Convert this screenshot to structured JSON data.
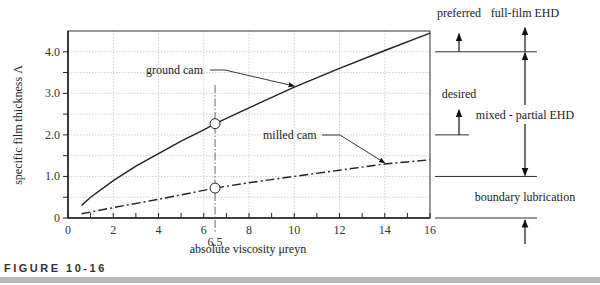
{
  "chart_data": {
    "type": "line",
    "title": "",
    "xlabel": "absolute viscosity   μreyn",
    "ylabel": "specific film thickness  Λ",
    "xlim": [
      0,
      16
    ],
    "ylim": [
      0,
      4.5
    ],
    "x_ticks": [
      0,
      2,
      4,
      6,
      8,
      10,
      12,
      14,
      16
    ],
    "y_ticks": [
      "0",
      "1.0",
      "2.0",
      "3.0",
      "4.0"
    ],
    "y_tick_values": [
      0,
      1,
      2,
      3,
      4
    ],
    "grid": true,
    "series": [
      {
        "name": "ground cam",
        "style": "solid",
        "x": [
          0.6,
          1,
          2,
          3,
          4,
          5,
          6,
          6.5,
          8,
          10,
          12,
          14,
          16
        ],
        "y": [
          0.3,
          0.5,
          0.9,
          1.25,
          1.55,
          1.85,
          2.12,
          2.27,
          2.65,
          3.15,
          3.6,
          4.03,
          4.45
        ]
      },
      {
        "name": "milled cam",
        "style": "dash-dot",
        "x": [
          0.6,
          2,
          4,
          6.5,
          8,
          10,
          12,
          14,
          16
        ],
        "y": [
          0.1,
          0.25,
          0.45,
          0.72,
          0.85,
          1.0,
          1.15,
          1.3,
          1.4
        ]
      }
    ],
    "annotations": [
      {
        "text": "6.5",
        "x": 6.5,
        "note": "marker line at viscosity 6.5"
      },
      {
        "text": "ground cam",
        "points_to_x": 10
      },
      {
        "text": "milled cam",
        "points_to_x": 14
      }
    ],
    "regions": [
      {
        "label": "full-film EHD",
        "from": 4.0,
        "to": null
      },
      {
        "label": "mixed - partial EHD",
        "from": 1.0,
        "to": 4.0
      },
      {
        "label": "boundary lubrication",
        "from": 0,
        "to": 1.0
      }
    ],
    "thresholds": [
      {
        "label": "preferred",
        "value": 4.0
      },
      {
        "label": "desired",
        "value": 2.0
      }
    ]
  },
  "caption": "FIGURE 10-16"
}
